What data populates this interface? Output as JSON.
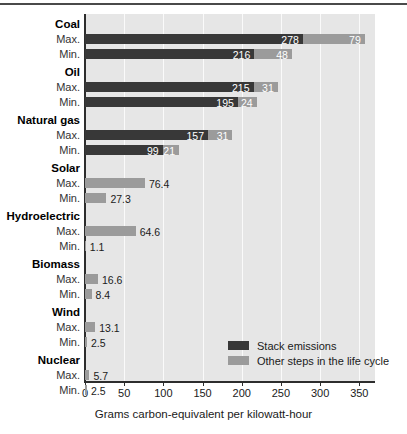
{
  "chart_data": {
    "type": "bar",
    "orientation": "horizontal",
    "stacked": true,
    "title": "",
    "xlabel": "Grams carbon-equivalent per kilowatt-hour",
    "ylabel": "",
    "xlim": [
      0,
      370
    ],
    "xticks": [
      0,
      50,
      100,
      150,
      200,
      250,
      300,
      350
    ],
    "xtick_labels": [
      "0",
      "50",
      "100",
      "150",
      "200",
      "250",
      "300",
      "350"
    ],
    "grid": "vertical-white",
    "legend_position": "inside-bottom-right",
    "series": [
      {
        "name": "Stack emissions",
        "color": "#383838"
      },
      {
        "name": "Other steps in the life cycle",
        "color": "#9b9b9b"
      }
    ],
    "groups": [
      {
        "label": "Coal",
        "rows": [
          {
            "label": "Max.",
            "stack": 278,
            "other": 79,
            "stack_text": "278",
            "other_text": "79",
            "stack_inside": true,
            "other_inside": true
          },
          {
            "label": "Min.",
            "stack": 216,
            "other": 48,
            "stack_text": "216",
            "other_text": "48",
            "stack_inside": true,
            "other_inside": true
          }
        ]
      },
      {
        "label": "Oil",
        "rows": [
          {
            "label": "Max.",
            "stack": 215,
            "other": 31,
            "stack_text": "215",
            "other_text": "31",
            "stack_inside": true,
            "other_inside": true
          },
          {
            "label": "Min.",
            "stack": 195,
            "other": 24,
            "stack_text": "195",
            "other_text": "24",
            "stack_inside": true,
            "other_inside": true
          }
        ]
      },
      {
        "label": "Natural gas",
        "rows": [
          {
            "label": "Max.",
            "stack": 157,
            "other": 31,
            "stack_text": "157",
            "other_text": "31",
            "stack_inside": true,
            "other_inside": true
          },
          {
            "label": "Min.",
            "stack": 99,
            "other": 21,
            "stack_text": "99",
            "other_text": "21",
            "stack_inside": true,
            "other_inside": true
          }
        ]
      },
      {
        "label": "Solar",
        "rows": [
          {
            "label": "Max.",
            "stack": 0,
            "other": 76.4,
            "stack_text": "",
            "other_text": "76.4",
            "stack_inside": false,
            "other_inside": false
          },
          {
            "label": "Min.",
            "stack": 0,
            "other": 27.3,
            "stack_text": "",
            "other_text": "27.3",
            "stack_inside": false,
            "other_inside": false
          }
        ]
      },
      {
        "label": "Hydroelectric",
        "rows": [
          {
            "label": "Max.",
            "stack": 0,
            "other": 64.6,
            "stack_text": "",
            "other_text": "64.6",
            "stack_inside": false,
            "other_inside": false
          },
          {
            "label": "Min.",
            "stack": 0,
            "other": 1.1,
            "stack_text": "",
            "other_text": "1.1",
            "stack_inside": false,
            "other_inside": false
          }
        ]
      },
      {
        "label": "Biomass",
        "rows": [
          {
            "label": "Max.",
            "stack": 0,
            "other": 16.6,
            "stack_text": "",
            "other_text": "16.6",
            "stack_inside": false,
            "other_inside": false
          },
          {
            "label": "Min.",
            "stack": 0,
            "other": 8.4,
            "stack_text": "",
            "other_text": "8.4",
            "stack_inside": false,
            "other_inside": false
          }
        ]
      },
      {
        "label": "Wind",
        "rows": [
          {
            "label": "Max.",
            "stack": 0,
            "other": 13.1,
            "stack_text": "",
            "other_text": "13.1",
            "stack_inside": false,
            "other_inside": false
          },
          {
            "label": "Min.",
            "stack": 0,
            "other": 2.5,
            "stack_text": "",
            "other_text": "2.5",
            "stack_inside": false,
            "other_inside": false
          }
        ]
      },
      {
        "label": "Nuclear",
        "rows": [
          {
            "label": "Max.",
            "stack": 0,
            "other": 5.7,
            "stack_text": "",
            "other_text": "5.7",
            "stack_inside": false,
            "other_inside": false
          },
          {
            "label": "Min.",
            "stack": 0,
            "other": 2.5,
            "stack_text": "",
            "other_text": "2.5",
            "stack_inside": false,
            "other_inside": false
          }
        ]
      }
    ]
  },
  "legend": {
    "items": [
      {
        "label": "Stack emissions",
        "color": "#383838"
      },
      {
        "label": "Other steps in the life cycle",
        "color": "#9b9b9b"
      }
    ]
  },
  "axis": {
    "xlabel": "Grams carbon-equivalent per kilowatt-hour"
  },
  "colors": {
    "stack": "#383838",
    "other": "#9b9b9b",
    "plot_background": "#e6e6e6",
    "gridline": "#fafafa",
    "axis": "#2d2d2d"
  }
}
